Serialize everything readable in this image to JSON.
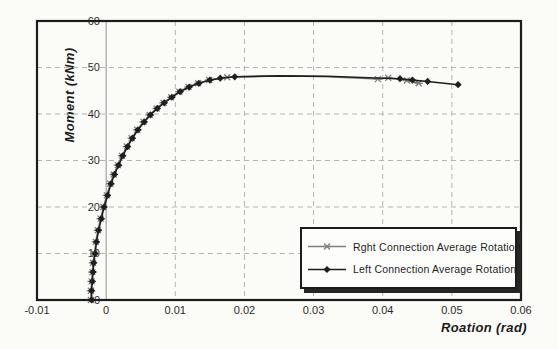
{
  "figure": {
    "background": "#fbfbf8",
    "frame_color": "#1c1c1c",
    "grid_color": "#b5b5b5",
    "zero_axis_color": "#8f8f8f",
    "tick_color": "#2b2b2b"
  },
  "chart_data": {
    "type": "line",
    "title": "",
    "xlabel": "Roation (rad)",
    "ylabel": "Moment (kNm)",
    "xlim": [
      -0.01,
      0.06
    ],
    "ylim": [
      0,
      60
    ],
    "xticks": [
      "-0.01",
      "0",
      "0.01",
      "0.02",
      "0.03",
      "0.04",
      "0.05",
      "0.06"
    ],
    "yticks": [
      "0",
      "10",
      "20",
      "30",
      "40",
      "50",
      "60"
    ],
    "grid": "dashed",
    "legend_position": "inside-lower-right",
    "series": [
      {
        "name": "Rght Connection Average Rotation",
        "marker": "star",
        "color": "#7f7f7f",
        "points": [
          [
            -0.0022,
            0,
            1
          ],
          [
            -0.0022,
            2,
            1
          ],
          [
            -0.0021,
            4,
            1
          ],
          [
            -0.002,
            6,
            1
          ],
          [
            -0.0019,
            8,
            1
          ],
          [
            -0.0017,
            10,
            1
          ],
          [
            -0.0015,
            12.5,
            1
          ],
          [
            -0.0012,
            15,
            1
          ],
          [
            -0.0008,
            17.5,
            1
          ],
          [
            -0.0004,
            20,
            1
          ],
          [
            0.0001,
            22.5,
            1
          ],
          [
            0.0006,
            25,
            1
          ],
          [
            0.0011,
            27,
            1
          ],
          [
            0.0017,
            29,
            1
          ],
          [
            0.0023,
            31,
            1
          ],
          [
            0.003,
            33,
            1
          ],
          [
            0.0037,
            34.8,
            1
          ],
          [
            0.0045,
            36.6,
            1
          ],
          [
            0.0054,
            38.3,
            1
          ],
          [
            0.0063,
            39.8,
            1
          ],
          [
            0.0073,
            41.2,
            1
          ],
          [
            0.0083,
            42.4,
            1
          ],
          [
            0.0094,
            43.6,
            1
          ],
          [
            0.0106,
            44.8,
            1
          ],
          [
            0.0119,
            45.8,
            1
          ],
          [
            0.0133,
            46.6,
            1
          ],
          [
            0.0149,
            47.3,
            1
          ],
          [
            0.0175,
            47.9,
            1
          ],
          [
            0.025,
            48.2,
            0
          ],
          [
            0.032,
            48.0,
            0
          ],
          [
            0.0393,
            47.5,
            1
          ],
          [
            0.0408,
            47.8,
            1
          ],
          [
            0.0435,
            47.2,
            1
          ],
          [
            0.0452,
            46.6,
            1
          ]
        ]
      },
      {
        "name": "Left Connection Average Rotation",
        "marker": "diamond",
        "color": "#1f1f1f",
        "points": [
          [
            -0.0021,
            0,
            1
          ],
          [
            -0.0021,
            2,
            1
          ],
          [
            -0.002,
            4,
            1
          ],
          [
            -0.0019,
            6,
            1
          ],
          [
            -0.0018,
            8,
            1
          ],
          [
            -0.0016,
            10,
            1
          ],
          [
            -0.0014,
            12.5,
            1
          ],
          [
            -0.0011,
            15,
            1
          ],
          [
            -0.0007,
            17.5,
            1
          ],
          [
            -0.0003,
            20,
            1
          ],
          [
            0.0002,
            22.5,
            1
          ],
          [
            0.0007,
            25,
            1
          ],
          [
            0.0012,
            27,
            1
          ],
          [
            0.0018,
            29,
            1
          ],
          [
            0.0024,
            31,
            1
          ],
          [
            0.0031,
            33,
            1
          ],
          [
            0.0038,
            34.8,
            1
          ],
          [
            0.0046,
            36.6,
            1
          ],
          [
            0.0055,
            38.3,
            1
          ],
          [
            0.0064,
            39.8,
            1
          ],
          [
            0.0074,
            41.2,
            1
          ],
          [
            0.0084,
            42.4,
            1
          ],
          [
            0.0095,
            43.6,
            1
          ],
          [
            0.0107,
            44.8,
            1
          ],
          [
            0.012,
            45.8,
            1
          ],
          [
            0.0134,
            46.6,
            1
          ],
          [
            0.015,
            47.3,
            1
          ],
          [
            0.0165,
            47.7,
            1
          ],
          [
            0.0186,
            48.0,
            1
          ],
          [
            0.025,
            48.2,
            0
          ],
          [
            0.032,
            48.1,
            0
          ],
          [
            0.038,
            47.8,
            0
          ],
          [
            0.0425,
            47.6,
            1
          ],
          [
            0.0443,
            47.3,
            1
          ],
          [
            0.0465,
            47.0,
            1
          ],
          [
            0.0509,
            46.3,
            1
          ]
        ]
      }
    ]
  }
}
